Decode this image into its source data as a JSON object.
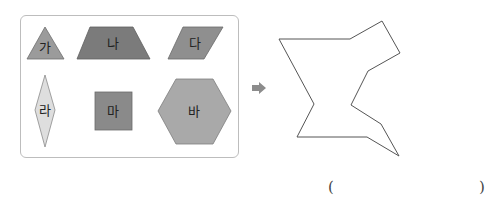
{
  "pieces": [
    {
      "id": "ga",
      "label": "가",
      "shape": "triangle",
      "color": "#9b9b9b"
    },
    {
      "id": "na",
      "label": "나",
      "shape": "trapezoid",
      "color": "#7b7b7b"
    },
    {
      "id": "da",
      "label": "다",
      "shape": "parallelogram",
      "color": "#8f8f8f"
    },
    {
      "id": "ra",
      "label": "라",
      "shape": "rhombus",
      "color": "#dedede"
    },
    {
      "id": "ma",
      "label": "마",
      "shape": "square",
      "color": "#8a8a8a"
    },
    {
      "id": "ba",
      "label": "바",
      "shape": "hexagon",
      "color": "#a9a9a9"
    }
  ],
  "arrow": {
    "icon": "right-arrow-icon",
    "color": "#8c8c8c"
  },
  "target_figure": {
    "stroke": "#555555"
  },
  "answer": {
    "open": "(",
    "close": ")",
    "value": ""
  }
}
